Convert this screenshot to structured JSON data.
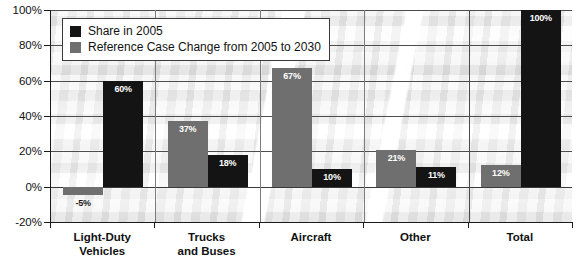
{
  "chart_data": {
    "type": "bar",
    "title": "",
    "xlabel": "",
    "ylabel": "",
    "ylim": [
      -20,
      100
    ],
    "grid": true,
    "legend_position": "top-left",
    "categories": [
      "Light-Duty Vehicles",
      "Trucks and Buses",
      "Aircraft",
      "Other",
      "Total"
    ],
    "category_lines": [
      [
        "Light-Duty",
        "Vehicles"
      ],
      [
        "Trucks",
        "and Buses"
      ],
      [
        "Aircraft"
      ],
      [
        "Other"
      ],
      [
        "Total"
      ]
    ],
    "ytick_labels": [
      "100%",
      "80%",
      "60%",
      "40%",
      "20%",
      "0%",
      "-20%"
    ],
    "ytick_values": [
      100,
      80,
      60,
      40,
      20,
      0,
      -20
    ],
    "series": [
      {
        "name": "Share in 2005",
        "color": "#141414",
        "values": [
          60,
          18,
          10,
          11,
          100
        ],
        "labels": [
          "60%",
          "18%",
          "10%",
          "11%",
          "100%"
        ]
      },
      {
        "name": "Reference Case Change from 2005 to 2030",
        "color": "#6f6f6f",
        "values": [
          -5,
          37,
          67,
          21,
          12
        ],
        "labels": [
          "-5%",
          "37%",
          "67%",
          "21%",
          "12%"
        ]
      }
    ]
  },
  "legend": {
    "items": [
      {
        "label": "Share in 2005",
        "swatch": "black-square-swatch"
      },
      {
        "label": "Reference Case Change from 2005 to 2030",
        "swatch": "gray-square-swatch"
      }
    ]
  },
  "axis": {
    "y_labels": [
      "100%",
      "80%",
      "60%",
      "40%",
      "20%",
      "0%",
      "-20%"
    ],
    "x_labels": [
      "Light-Duty Vehicles",
      "Trucks and Buses",
      "Aircraft",
      "Other",
      "Total"
    ]
  },
  "bars": [
    {
      "group": "Light-Duty Vehicles",
      "series": "Reference Case Change from 2005 to 2030",
      "value": -5,
      "label": "-5%"
    },
    {
      "group": "Light-Duty Vehicles",
      "series": "Share in 2005",
      "value": 60,
      "label": "60%"
    },
    {
      "group": "Trucks and Buses",
      "series": "Reference Case Change from 2005 to 2030",
      "value": 37,
      "label": "37%"
    },
    {
      "group": "Trucks and Buses",
      "series": "Share in 2005",
      "value": 18,
      "label": "18%"
    },
    {
      "group": "Aircraft",
      "series": "Reference Case Change from 2005 to 2030",
      "value": 67,
      "label": "67%"
    },
    {
      "group": "Aircraft",
      "series": "Share in 2005",
      "value": 10,
      "label": "10%"
    },
    {
      "group": "Other",
      "series": "Reference Case Change from 2005 to 2030",
      "value": 21,
      "label": "21%"
    },
    {
      "group": "Other",
      "series": "Share in 2005",
      "value": 11,
      "label": "11%"
    },
    {
      "group": "Total",
      "series": "Reference Case Change from 2005 to 2030",
      "value": 12,
      "label": "12%"
    },
    {
      "group": "Total",
      "series": "Share in 2005",
      "value": 100,
      "label": "100%"
    }
  ],
  "colors": {
    "series_share": "#141414",
    "series_change": "#6f6f6f",
    "axis": "#1a1a1a",
    "gridline": "#4d4d4d",
    "label_text": "#111111",
    "bar_label_text": "#ffffff"
  }
}
